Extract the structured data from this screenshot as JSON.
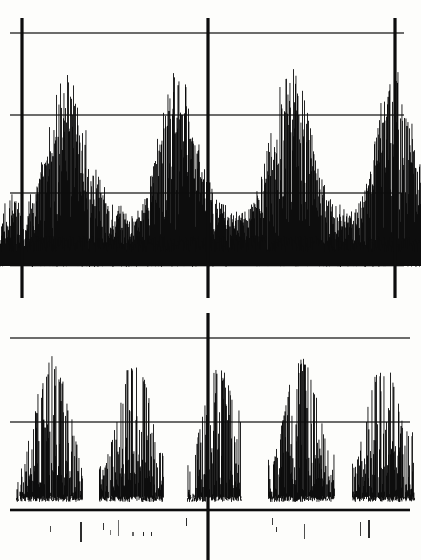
{
  "figure": {
    "title": "",
    "background_color": "#fdfdfb",
    "ink_color": "#0d0d0d",
    "width": 421,
    "height": 560,
    "media": "scanned-chart-recorder-trace"
  },
  "chart_data": {
    "type": "line",
    "title": "",
    "subtitle": "",
    "xlabel": "",
    "ylabel": "",
    "grid": true,
    "legend_position": "none",
    "panels": [
      {
        "name": "panel-top",
        "label": "",
        "plot_box": {
          "x0": 22,
          "y0": 18,
          "x1": 395,
          "y1": 265
        },
        "axis_lines": {
          "vertical_x": [
            22,
            208,
            395
          ],
          "vertical_y_extent": [
            18,
            298
          ],
          "horizontal_y": [
            33,
            115,
            193,
            265
          ],
          "horizontal_x_extent": [
            10,
            404
          ],
          "heavy_horizontal_y": [
            265
          ],
          "heavy_vertical_x": [
            22,
            208,
            395
          ]
        },
        "xlim": [
          0,
          421
        ],
        "ylim": [
          0,
          1
        ],
        "baseline_y": 258,
        "noise_floor_top_y": 193,
        "bursts": [
          {
            "center_x": 78,
            "peak_y": 55,
            "half_width": 52,
            "peak_label": "burst-1"
          },
          {
            "center_x": 160,
            "peak_y": 53,
            "half_width": 50,
            "peak_label": "burst-2"
          },
          {
            "center_x": 249,
            "peak_y": 52,
            "half_width": 52,
            "peak_label": "burst-3"
          },
          {
            "center_x": 340,
            "peak_y": 50,
            "half_width": 50,
            "peak_label": "burst-4"
          }
        ],
        "burst_period_px": 88,
        "series": [
          {
            "name": "trace",
            "x": [
              0,
              4,
              8,
              12,
              16,
              20,
              24,
              28,
              32,
              36,
              40,
              44,
              48,
              52,
              56,
              60,
              64,
              68,
              72,
              76,
              80,
              84,
              88,
              92,
              96,
              100,
              104,
              108,
              112,
              116,
              120,
              124,
              128,
              132,
              136,
              140,
              144,
              148,
              152,
              156,
              160,
              164,
              168,
              172,
              176,
              180,
              184,
              188,
              192,
              196,
              200,
              204,
              208,
              212,
              216,
              220,
              224,
              228,
              232,
              236,
              240,
              244,
              248,
              252,
              256,
              260,
              264,
              268,
              272,
              276,
              280,
              284,
              288,
              292,
              296,
              300,
              304,
              308,
              312,
              316,
              320,
              324,
              328,
              332,
              336,
              340,
              344,
              348,
              352,
              356,
              360,
              364,
              368,
              372,
              376,
              380,
              384,
              388,
              392,
              396,
              400,
              404,
              408,
              412,
              416,
              420
            ],
            "envelope_top": [
              200,
              196,
              192,
              190,
              196,
              200,
              198,
              194,
              188,
              176,
              160,
              142,
              124,
              106,
              90,
              74,
              60,
              56,
              62,
              78,
              96,
              116,
              134,
              150,
              164,
              176,
              186,
              192,
              196,
              200,
              202,
              204,
              206,
              208,
              210,
              206,
              196,
              180,
              160,
              138,
              116,
              96,
              78,
              62,
              54,
              56,
              66,
              82,
              100,
              120,
              140,
              158,
              172,
              184,
              192,
              198,
              202,
              204,
              206,
              208,
              210,
              208,
              204,
              198,
              188,
              174,
              156,
              136,
              114,
              94,
              76,
              62,
              54,
              52,
              58,
              72,
              90,
              110,
              130,
              148,
              164,
              178,
              188,
              194,
              198,
              200,
              202,
              204,
              206,
              202,
              192,
              176,
              156,
              134,
              112,
              92,
              74,
              60,
              52,
              54,
              64,
              80,
              98,
              118,
              138,
              156
            ],
            "envelope_bottom": [
              258,
              258,
              258,
              258,
              258,
              258,
              258,
              258,
              258,
              258,
              258,
              258,
              258,
              258,
              258,
              258,
              258,
              258,
              258,
              258,
              258,
              258,
              258,
              258,
              258,
              258,
              258,
              258,
              258,
              258,
              258,
              258,
              258,
              258,
              258,
              258,
              258,
              258,
              258,
              258,
              258,
              258,
              258,
              258,
              258,
              258,
              258,
              258,
              258,
              258,
              258,
              258,
              258,
              258,
              258,
              258,
              258,
              258,
              258,
              258,
              258,
              258,
              258,
              258,
              258,
              258,
              258,
              258,
              258,
              258,
              258,
              258,
              258,
              258,
              258,
              258,
              258,
              258,
              258,
              258,
              258,
              258,
              258,
              258,
              258,
              258,
              258,
              258,
              258,
              258,
              258,
              258,
              258,
              258,
              258,
              258,
              258,
              258,
              258,
              258,
              258,
              258,
              258,
              258,
              258,
              258
            ]
          }
        ]
      },
      {
        "name": "panel-bottom",
        "label": "",
        "plot_box": {
          "x0": 10,
          "y0": 338,
          "x1": 410,
          "y1": 510
        },
        "axis_lines": {
          "vertical_x": [
            208
          ],
          "vertical_y_extent": [
            313,
            560
          ],
          "horizontal_y": [
            338,
            422,
            510
          ],
          "horizontal_x_extent": [
            10,
            410
          ],
          "heavy_horizontal_y": [
            510
          ],
          "heavy_vertical_x": [
            208
          ]
        },
        "xlim": [
          0,
          421
        ],
        "ylim": [
          0,
          1
        ],
        "baseline_y": 500,
        "bursts": [
          {
            "center_x": 48,
            "peak_y": 353,
            "half_width": 28,
            "peak_label": "burst-1"
          },
          {
            "center_x": 130,
            "peak_y": 357,
            "half_width": 27,
            "peak_label": "burst-2"
          },
          {
            "center_x": 213,
            "peak_y": 362,
            "half_width": 22,
            "peak_label": "burst-3"
          },
          {
            "center_x": 300,
            "peak_y": 352,
            "half_width": 28,
            "peak_label": "burst-4"
          },
          {
            "center_x": 382,
            "peak_y": 358,
            "half_width": 26,
            "peak_label": "burst-5"
          }
        ],
        "burst_period_px": 84,
        "series": [
          {
            "name": "trace",
            "x": [
              20,
              28,
              36,
              44,
              52,
              60,
              68,
              76,
              104,
              112,
              120,
              128,
              136,
              144,
              152,
              160,
              192,
              200,
              208,
              216,
              224,
              232,
              272,
              280,
              288,
              296,
              304,
              312,
              320,
              328,
              356,
              364,
              372,
              380,
              388,
              396,
              404
            ],
            "envelope_top": [
              470,
              440,
              400,
              366,
              354,
              372,
              402,
              440,
              468,
              436,
              394,
              362,
              358,
              378,
              412,
              452,
              462,
              420,
              380,
              364,
              372,
              398,
              466,
              430,
              388,
              358,
              354,
              374,
              408,
              448,
              464,
              424,
              384,
              360,
              364,
              392,
              430
            ],
            "envelope_bottom": [
              500,
              500,
              500,
              500,
              500,
              500,
              500,
              500,
              500,
              500,
              500,
              500,
              500,
              500,
              500,
              500,
              500,
              500,
              500,
              500,
              500,
              500,
              500,
              500,
              500,
              500,
              500,
              500,
              500,
              500,
              500,
              500,
              500,
              500,
              500,
              500,
              500
            ]
          }
        ]
      },
      {
        "name": "panel-ticks",
        "label": "",
        "plot_box": {
          "x0": 10,
          "y0": 512,
          "x1": 410,
          "y1": 560
        },
        "description": "Sparse event tick marks below the lower panel.",
        "ticks": [
          {
            "x": 50,
            "y_top": 526,
            "height": 6,
            "width": 1
          },
          {
            "x": 80,
            "y_top": 522,
            "height": 20,
            "width": 2
          },
          {
            "x": 103,
            "y_top": 523,
            "height": 7,
            "width": 1
          },
          {
            "x": 110,
            "y_top": 530,
            "height": 5,
            "width": 1
          },
          {
            "x": 118,
            "y_top": 520,
            "height": 16,
            "width": 1
          },
          {
            "x": 132,
            "y_top": 532,
            "height": 4,
            "width": 2
          },
          {
            "x": 143,
            "y_top": 532,
            "height": 4,
            "width": 1
          },
          {
            "x": 151,
            "y_top": 532,
            "height": 4,
            "width": 1
          },
          {
            "x": 186,
            "y_top": 518,
            "height": 8,
            "width": 1
          },
          {
            "x": 272,
            "y_top": 518,
            "height": 7,
            "width": 1
          },
          {
            "x": 276,
            "y_top": 527,
            "height": 5,
            "width": 1
          },
          {
            "x": 304,
            "y_top": 524,
            "height": 15,
            "width": 1
          },
          {
            "x": 360,
            "y_top": 522,
            "height": 14,
            "width": 1
          },
          {
            "x": 368,
            "y_top": 520,
            "height": 18,
            "width": 2
          }
        ]
      }
    ]
  },
  "render_params": {
    "noise_seed": 20240517,
    "top_noise_density": 1.0,
    "top_line_width": 1,
    "bottom_line_width": 1,
    "grid_line_width_thin": 1.2,
    "grid_line_width_heavy": 2.6,
    "axis_line_width_heavy": 3.2
  }
}
